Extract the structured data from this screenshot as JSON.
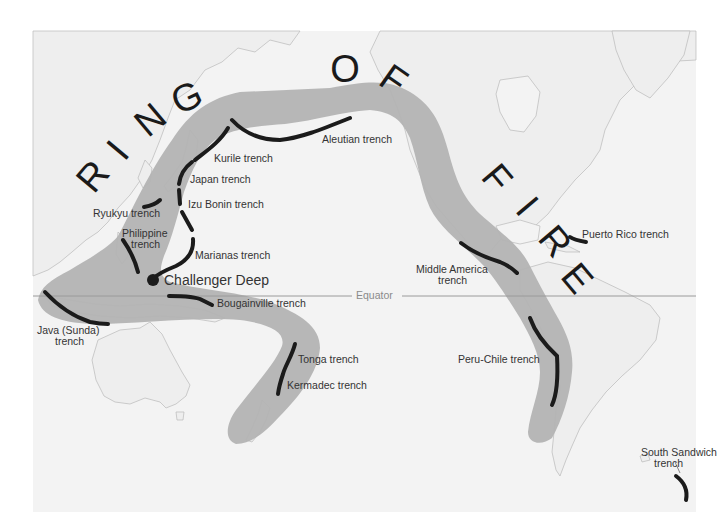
{
  "title": {
    "text": "RING OF FIRE",
    "letters": [
      {
        "char": "R",
        "x": 95,
        "y": 178,
        "rot": -50
      },
      {
        "char": "I",
        "x": 120,
        "y": 152,
        "rot": -50
      },
      {
        "char": "N",
        "x": 152,
        "y": 122,
        "rot": -40
      },
      {
        "char": "G",
        "x": 188,
        "y": 100,
        "rot": -25
      },
      {
        "char": "O",
        "x": 345,
        "y": 72,
        "rot": 0
      },
      {
        "char": "F",
        "x": 392,
        "y": 82,
        "rot": 35
      },
      {
        "char": "F",
        "x": 495,
        "y": 180,
        "rot": 50
      },
      {
        "char": "I",
        "x": 525,
        "y": 208,
        "rot": 50
      },
      {
        "char": "R",
        "x": 553,
        "y": 243,
        "rot": 50
      },
      {
        "char": "E",
        "x": 575,
        "y": 280,
        "rot": 50
      }
    ]
  },
  "colors": {
    "background": "#ffffff",
    "ocean": "#f3f3f3",
    "land": "#eeeeee",
    "coast": "#b9b9b9",
    "band": "#b3b3b3",
    "trench": "#1b1b1b",
    "equator": "#9a9a9a",
    "label": "#333333"
  },
  "equator": {
    "label": "Equator",
    "y": 296
  },
  "challenger_deep": {
    "label": "Challenger Deep",
    "x": 153,
    "y": 279
  },
  "trenches": [
    {
      "name": "Aleutian trench",
      "label": "Aleutian trench"
    },
    {
      "name": "Kurile trench",
      "label": "Kurile trench"
    },
    {
      "name": "Japan trench",
      "label": "Japan trench"
    },
    {
      "name": "Izu Bonin trench",
      "label": "Izu Bonin trench"
    },
    {
      "name": "Ryukyu trench",
      "label": "Ryukyu trench"
    },
    {
      "name": "Philippine trench",
      "label_line1": "Philippine",
      "label_line2": "trench"
    },
    {
      "name": "Marianas trench",
      "label": "Marianas trench"
    },
    {
      "name": "Bougainville trench",
      "label": "Bougainville trench"
    },
    {
      "name": "Java (Sunda) trench",
      "label_line1": "Java (Sunda)",
      "label_line2": "trench"
    },
    {
      "name": "Tonga trench",
      "label": "Tonga trench"
    },
    {
      "name": "Kermadec trench",
      "label": "Kermadec trench"
    },
    {
      "name": "Middle America trench",
      "label_line1": "Middle America",
      "label_line2": "trench"
    },
    {
      "name": "Peru-Chile trench",
      "label": "Peru-Chile  trench"
    },
    {
      "name": "Puerto Rico trench",
      "label": "Puerto Rico trench"
    },
    {
      "name": "South Sandwich trench",
      "label_line1": "South Sandwich",
      "label_line2": "trench"
    }
  ]
}
